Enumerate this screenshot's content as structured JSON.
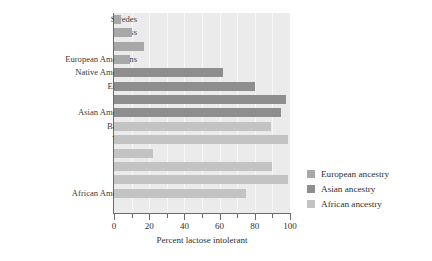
{
  "chart_data": {
    "type": "bar",
    "orientation": "horizontal",
    "title": "",
    "xlabel": "Percent lactose intolerant",
    "ylabel": "",
    "xlim": [
      0,
      100
    ],
    "xticks": [
      0,
      20,
      40,
      60,
      80,
      100
    ],
    "xtick_minor_step": 10,
    "grid": true,
    "legend_position": "right",
    "categories": [
      "Swedes",
      "Swiss",
      "Finns",
      "European Americans",
      "Native Americans",
      "Eskimos",
      "Thais",
      "Asian Americans",
      "Baganda",
      "Yoruba",
      "Fulani",
      "Bantus",
      "Ibos",
      "African Americans"
    ],
    "values": [
      4,
      10,
      17,
      9,
      62,
      80,
      98,
      95,
      89,
      99,
      22,
      90,
      99,
      75
    ],
    "groups": [
      "european",
      "european",
      "european",
      "european",
      "asian",
      "asian",
      "asian",
      "asian",
      "african",
      "african",
      "african",
      "african",
      "african",
      "african"
    ],
    "series": [
      {
        "name": "European ancestry",
        "color": "#a8a8a8",
        "points": [
          {
            "category": "Swedes",
            "value": 4
          },
          {
            "category": "Swiss",
            "value": 10
          },
          {
            "category": "Finns",
            "value": 17
          },
          {
            "category": "European Americans",
            "value": 9
          }
        ]
      },
      {
        "name": "Asian ancestry",
        "color": "#8e8e8e",
        "points": [
          {
            "category": "Native Americans",
            "value": 62
          },
          {
            "category": "Eskimos",
            "value": 80
          },
          {
            "category": "Thais",
            "value": 98
          },
          {
            "category": "Asian Americans",
            "value": 95
          }
        ]
      },
      {
        "name": "African ancestry",
        "color": "#c3c3c3",
        "points": [
          {
            "category": "Baganda",
            "value": 89
          },
          {
            "category": "Yoruba",
            "value": 99
          },
          {
            "category": "Fulani",
            "value": 22
          },
          {
            "category": "Bantus",
            "value": 90
          },
          {
            "category": "Ibos",
            "value": 99
          },
          {
            "category": "African Americans",
            "value": 75
          }
        ]
      }
    ]
  },
  "axis": {
    "x_title": "Percent lactose intolerant",
    "tick_labels": [
      "0",
      "20",
      "40",
      "60",
      "80",
      "100"
    ]
  },
  "legend": {
    "items": [
      {
        "label": "European ancestry",
        "swatch": "european"
      },
      {
        "label": "Asian ancestry",
        "swatch": "asian"
      },
      {
        "label": "African ancestry",
        "swatch": "african"
      }
    ]
  },
  "colors": {
    "european": "#a8a8a8",
    "asian": "#8e8e8e",
    "african": "#c3c3c3",
    "panel": "#ebebeb",
    "axis": "#6b6b6b"
  }
}
